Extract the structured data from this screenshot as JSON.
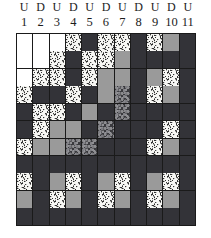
{
  "figure": {
    "kind": "texture-grid-matrix",
    "columns": 11,
    "rows": 11
  },
  "header": {
    "ud_labels": [
      "U",
      "D",
      "U",
      "D",
      "U",
      "D",
      "U",
      "D",
      "U",
      "D",
      "U"
    ],
    "numbers": [
      "1",
      "2",
      "3",
      "4",
      "5",
      "6",
      "7",
      "8",
      "9",
      "10",
      "11"
    ]
  },
  "legend": {
    "fill_types": {
      "white": "plain white cell",
      "stipple": "light speckled / dotted cell",
      "gray": "medium gray cell",
      "dark": "dark near-black cell",
      "darktex": "dark mottled textured cell"
    },
    "colors": {
      "white": "#ffffff",
      "stipple": "#f7f7f4",
      "gray": "#9a9a9a",
      "dark": "#333338",
      "darktex": "#3a3a3e",
      "grid_line": "#1a1a1a",
      "label_text": "#1c1c1c"
    }
  },
  "chart_data": {
    "type": "heatmap",
    "title": "",
    "xlabel": "",
    "ylabel": "",
    "categories": [
      "1",
      "2",
      "3",
      "4",
      "5",
      "6",
      "7",
      "8",
      "9",
      "10",
      "11"
    ],
    "column_group_labels": [
      "U",
      "D",
      "U",
      "D",
      "U",
      "D",
      "U",
      "D",
      "U",
      "D",
      "U"
    ],
    "value_scale": [
      "white",
      "stipple",
      "gray",
      "darktex",
      "dark"
    ],
    "grid": true,
    "legend_position": "none",
    "cells": [
      [
        "white",
        "white",
        "white",
        "stipple",
        "dark",
        "stipple",
        "stipple",
        "dark",
        "stipple",
        "gray",
        "dark"
      ],
      [
        "white",
        "white",
        "stipple",
        "dark",
        "stipple",
        "stipple",
        "gray",
        "dark",
        "dark",
        "dark",
        "dark"
      ],
      [
        "white",
        "stipple",
        "stipple",
        "dark",
        "stipple",
        "gray",
        "gray",
        "dark",
        "gray",
        "stipple",
        "dark"
      ],
      [
        "stipple",
        "dark",
        "dark",
        "stipple",
        "dark",
        "gray",
        "darktex",
        "dark",
        "stipple",
        "gray",
        "dark"
      ],
      [
        "dark",
        "stipple",
        "stipple",
        "dark",
        "gray",
        "dark",
        "darktex",
        "dark",
        "dark",
        "dark",
        "dark"
      ],
      [
        "dark",
        "stipple",
        "gray",
        "gray",
        "dark",
        "darktex",
        "dark",
        "dark",
        "dark",
        "stipple",
        "dark"
      ],
      [
        "stipple",
        "gray",
        "gray",
        "darktex",
        "darktex",
        "dark",
        "dark",
        "dark",
        "stipple",
        "gray",
        "dark"
      ],
      [
        "dark",
        "dark",
        "dark",
        "dark",
        "dark",
        "dark",
        "dark",
        "dark",
        "dark",
        "dark",
        "dark"
      ],
      [
        "stipple",
        "dark",
        "gray",
        "stipple",
        "dark",
        "gray",
        "stipple",
        "dark",
        "gray",
        "stipple",
        "dark"
      ],
      [
        "gray",
        "dark",
        "stipple",
        "gray",
        "dark",
        "stipple",
        "gray",
        "dark",
        "stipple",
        "gray",
        "dark"
      ],
      [
        "dark",
        "dark",
        "dark",
        "dark",
        "dark",
        "dark",
        "dark",
        "dark",
        "dark",
        "dark",
        "dark"
      ]
    ]
  }
}
